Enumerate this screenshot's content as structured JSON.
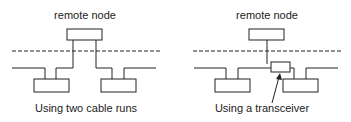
{
  "diagrams": [
    {
      "title": "remote node",
      "caption": "Using two cable runs"
    },
    {
      "title": "remote node",
      "caption": "Using a transceiver"
    }
  ],
  "colors": {
    "stroke": "#222222",
    "background": "#ffffff"
  }
}
